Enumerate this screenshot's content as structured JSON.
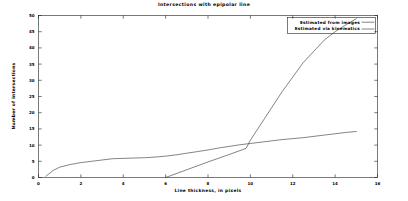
{
  "chart_data": {
    "type": "line",
    "title": "Intersections with epipolar line",
    "xlabel": "Line thickness, in pixels",
    "ylabel": "Number of intersections",
    "xlim": [
      0,
      16
    ],
    "ylim": [
      0,
      50
    ],
    "xticks": [
      0,
      2,
      4,
      6,
      8,
      10,
      12,
      14,
      16
    ],
    "xtick_labels": [
      "0",
      "2",
      "4",
      "6",
      "8",
      "10",
      "12",
      "14",
      "16"
    ],
    "yticks": [
      0,
      5,
      10,
      15,
      20,
      25,
      30,
      35,
      40,
      45,
      50
    ],
    "ytick_labels": [
      "0",
      "5",
      "10",
      "15",
      "20",
      "25",
      "30",
      "35",
      "40",
      "45",
      "50"
    ],
    "grid": false,
    "legend_position": "top-right",
    "series": [
      {
        "name": "Estimated from images",
        "color": "#303030",
        "points": [
          [
            0.35,
            0.4
          ],
          [
            0.7,
            2.2
          ],
          [
            1.0,
            3.2
          ],
          [
            1.5,
            4.0
          ],
          [
            2.0,
            4.6
          ],
          [
            2.5,
            5.0
          ],
          [
            3.0,
            5.4
          ],
          [
            3.5,
            5.8
          ],
          [
            4.0,
            5.9
          ],
          [
            4.5,
            6.0
          ],
          [
            5.0,
            6.1
          ],
          [
            5.5,
            6.3
          ],
          [
            6.0,
            6.6
          ],
          [
            6.5,
            7.0
          ],
          [
            7.0,
            7.5
          ],
          [
            7.5,
            8.0
          ],
          [
            8.0,
            8.5
          ],
          [
            8.5,
            9.1
          ],
          [
            9.0,
            9.6
          ],
          [
            9.5,
            10.1
          ],
          [
            10.0,
            10.5
          ],
          [
            10.5,
            10.9
          ],
          [
            11.0,
            11.3
          ],
          [
            11.5,
            11.7
          ],
          [
            12.0,
            12.0
          ],
          [
            12.5,
            12.3
          ],
          [
            13.0,
            12.7
          ],
          [
            13.5,
            13.1
          ],
          [
            14.0,
            13.5
          ],
          [
            14.5,
            13.9
          ],
          [
            15.0,
            14.2
          ]
        ]
      },
      {
        "name": "Estimated via kinematics",
        "color": "#303030",
        "points": [
          [
            6.0,
            0.0
          ],
          [
            7.0,
            2.4
          ],
          [
            8.0,
            4.8
          ],
          [
            9.0,
            7.1
          ],
          [
            9.8,
            9.0
          ],
          [
            10.0,
            11.5
          ],
          [
            10.5,
            16.5
          ],
          [
            11.0,
            21.5
          ],
          [
            11.5,
            26.5
          ],
          [
            12.0,
            31.0
          ],
          [
            12.5,
            35.5
          ],
          [
            13.0,
            39.0
          ],
          [
            13.5,
            42.5
          ],
          [
            14.0,
            45.0
          ],
          [
            14.6,
            47.5
          ],
          [
            15.0,
            49.0
          ]
        ]
      }
    ]
  },
  "legend": {
    "entries": [
      {
        "label": "Estimated from images"
      },
      {
        "label": "Estimated via kinematics"
      }
    ]
  }
}
